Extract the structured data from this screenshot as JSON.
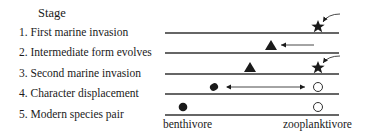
{
  "title": "Stage",
  "stages": [
    {
      "label": "1. First marine invasion"
    },
    {
      "label": "2. Intermediate form evolves"
    },
    {
      "label": "3. Second marine invasion"
    },
    {
      "label": "4. Character displacement"
    },
    {
      "label": "5. Modern species pair"
    }
  ],
  "axis_labels": {
    "left": "benthivore",
    "right": "zooplanktivore"
  },
  "symbols": {
    "star": "marine ancestor",
    "triangle": "intermediate form",
    "filled_circle": "benthivore form",
    "open_circle": "zooplanktivore form"
  },
  "colors": {
    "ink": "#1a1a1a",
    "line": "#333333",
    "background": "#ffffff"
  }
}
